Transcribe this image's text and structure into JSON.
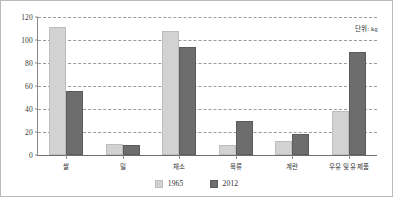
{
  "chart_data": {
    "type": "bar",
    "title": "",
    "subtitle": "",
    "xlabel": "",
    "ylabel": "",
    "ylim": [
      0,
      120
    ],
    "ytick_step": 20,
    "yticks": [
      "0",
      "20",
      "40",
      "60",
      "80",
      "100",
      "120"
    ],
    "grid": true,
    "legend_position": "bottom-center",
    "annotation": "단위: kg",
    "categories": [
      "쌀",
      "밀",
      "채소",
      "육류",
      "계란",
      "우유 및 유제품"
    ],
    "series": [
      {
        "name": "1965",
        "color": "#d2d2d2",
        "values": [
          111,
          10,
          108,
          9,
          12,
          38
        ]
      },
      {
        "name": "2012",
        "color": "#6d6d6d",
        "values": [
          56,
          8.5,
          94,
          30,
          18,
          90
        ]
      }
    ]
  },
  "figure": {
    "border_color": "#b9b9b9",
    "background": "#ffffff",
    "axis_color": "#8a8a8a",
    "grid_color": "#9b9b9b"
  }
}
